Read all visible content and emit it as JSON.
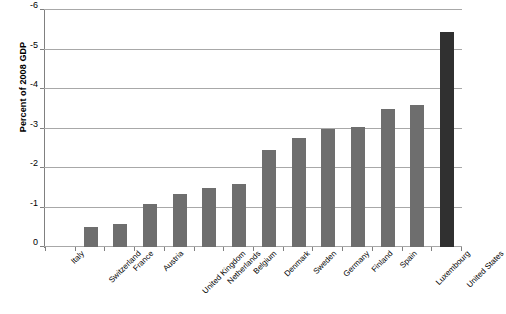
{
  "chart_data": {
    "type": "bar",
    "title": "",
    "xlabel": "",
    "ylabel": "Percent of 2008 GDP",
    "ylim": [
      0,
      -6
    ],
    "yticks": [
      0,
      -1,
      -2,
      -3,
      -4,
      -5,
      -6
    ],
    "ytick_labels": [
      "0",
      "-1",
      "-2",
      "-3",
      "-4",
      "-5",
      "-6"
    ],
    "grid": true,
    "legend": "none",
    "axis_inverted": true,
    "note": "y axis increases downward in magnitude; 0 at bottom, -6 at top",
    "categories": [
      "Italy",
      "Switzerland",
      "France",
      "Austria",
      "United Kingdom",
      "Netherlands",
      "Belgium",
      "Denmark",
      "Sweden",
      "Germany",
      "Finland",
      "Spain",
      "Luxembourg",
      "United States"
    ],
    "values": [
      0.0,
      -0.5,
      -0.58,
      -1.08,
      -1.35,
      -1.5,
      -1.6,
      -2.45,
      -2.75,
      -3.0,
      -3.05,
      -3.5,
      -3.6,
      -5.45
    ],
    "colors": {
      "bar": "#6e6e6e",
      "bar_highlight": "#303030",
      "gridline": "#a8a8a8",
      "axis": "#808080",
      "text": "#000000",
      "background": "#ffffff"
    },
    "highlight_category": "United States"
  }
}
